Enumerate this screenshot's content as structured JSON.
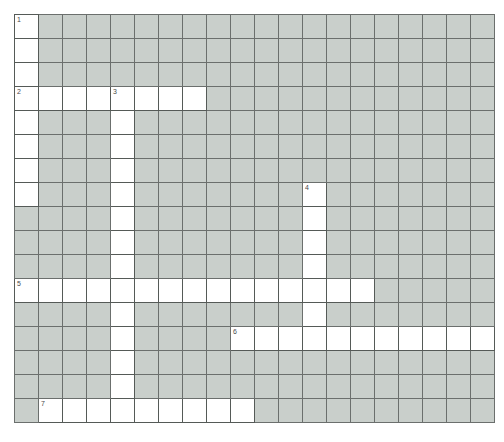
{
  "puzzle": {
    "type": "crossword-grid",
    "columns": 20,
    "rows": 17,
    "cell_size_px": 24,
    "origin_px": {
      "x": 14,
      "y": 14
    },
    "colors": {
      "background": "#ffffff",
      "open_cell": "#ffffff",
      "blocked_cell": "#c9cfcb",
      "grid_line": "#6e6e6e",
      "number_text": "#4a4a4a"
    },
    "clue_numbers": [
      {
        "label": "1",
        "row": 0,
        "col": 0
      },
      {
        "label": "2",
        "row": 3,
        "col": 0
      },
      {
        "label": "3",
        "row": 3,
        "col": 4
      },
      {
        "label": "4",
        "row": 7,
        "col": 12
      },
      {
        "label": "5",
        "row": 11,
        "col": 0
      },
      {
        "label": "6",
        "row": 13,
        "col": 9
      },
      {
        "label": "7",
        "row": 16,
        "col": 1
      }
    ],
    "open_cells": [
      [
        0,
        0
      ],
      [
        1,
        0
      ],
      [
        2,
        0
      ],
      [
        3,
        0
      ],
      [
        3,
        1
      ],
      [
        3,
        2
      ],
      [
        3,
        3
      ],
      [
        3,
        4
      ],
      [
        3,
        5
      ],
      [
        3,
        6
      ],
      [
        3,
        7
      ],
      [
        4,
        0
      ],
      [
        4,
        4
      ],
      [
        5,
        0
      ],
      [
        5,
        4
      ],
      [
        6,
        0
      ],
      [
        6,
        4
      ],
      [
        7,
        0
      ],
      [
        7,
        4
      ],
      [
        7,
        12
      ],
      [
        8,
        4
      ],
      [
        8,
        12
      ],
      [
        9,
        4
      ],
      [
        9,
        12
      ],
      [
        10,
        4
      ],
      [
        10,
        12
      ],
      [
        11,
        0
      ],
      [
        11,
        1
      ],
      [
        11,
        2
      ],
      [
        11,
        3
      ],
      [
        11,
        4
      ],
      [
        11,
        5
      ],
      [
        11,
        6
      ],
      [
        11,
        7
      ],
      [
        11,
        8
      ],
      [
        11,
        9
      ],
      [
        11,
        10
      ],
      [
        11,
        11
      ],
      [
        11,
        12
      ],
      [
        11,
        13
      ],
      [
        11,
        14
      ],
      [
        12,
        4
      ],
      [
        12,
        12
      ],
      [
        13,
        4
      ],
      [
        13,
        9
      ],
      [
        13,
        10
      ],
      [
        13,
        11
      ],
      [
        13,
        12
      ],
      [
        13,
        13
      ],
      [
        13,
        14
      ],
      [
        13,
        15
      ],
      [
        13,
        16
      ],
      [
        13,
        17
      ],
      [
        13,
        18
      ],
      [
        13,
        19
      ],
      [
        14,
        4
      ],
      [
        15,
        4
      ],
      [
        16,
        1
      ],
      [
        16,
        2
      ],
      [
        16,
        3
      ],
      [
        16,
        4
      ],
      [
        16,
        5
      ],
      [
        16,
        6
      ],
      [
        16,
        7
      ],
      [
        16,
        8
      ],
      [
        16,
        9
      ]
    ],
    "grid": [
      [
        "open",
        "blocked",
        "blocked",
        "blocked",
        "blocked",
        "blocked",
        "blocked",
        "blocked",
        "blocked",
        "blocked",
        "blocked",
        "blocked",
        "blocked",
        "blocked",
        "blocked",
        "blocked",
        "blocked",
        "blocked",
        "blocked",
        "blocked"
      ],
      [
        "open",
        "blocked",
        "blocked",
        "blocked",
        "blocked",
        "blocked",
        "blocked",
        "blocked",
        "blocked",
        "blocked",
        "blocked",
        "blocked",
        "blocked",
        "blocked",
        "blocked",
        "blocked",
        "blocked",
        "blocked",
        "blocked",
        "blocked"
      ],
      [
        "open",
        "blocked",
        "blocked",
        "blocked",
        "blocked",
        "blocked",
        "blocked",
        "blocked",
        "blocked",
        "blocked",
        "blocked",
        "blocked",
        "blocked",
        "blocked",
        "blocked",
        "blocked",
        "blocked",
        "blocked",
        "blocked",
        "blocked"
      ],
      [
        "open",
        "open",
        "open",
        "open",
        "open",
        "open",
        "open",
        "open",
        "blocked",
        "blocked",
        "blocked",
        "blocked",
        "blocked",
        "blocked",
        "blocked",
        "blocked",
        "blocked",
        "blocked",
        "blocked",
        "blocked"
      ],
      [
        "open",
        "blocked",
        "blocked",
        "blocked",
        "open",
        "blocked",
        "blocked",
        "blocked",
        "blocked",
        "blocked",
        "blocked",
        "blocked",
        "blocked",
        "blocked",
        "blocked",
        "blocked",
        "blocked",
        "blocked",
        "blocked",
        "blocked"
      ],
      [
        "open",
        "blocked",
        "blocked",
        "blocked",
        "open",
        "blocked",
        "blocked",
        "blocked",
        "blocked",
        "blocked",
        "blocked",
        "blocked",
        "blocked",
        "blocked",
        "blocked",
        "blocked",
        "blocked",
        "blocked",
        "blocked",
        "blocked"
      ],
      [
        "open",
        "blocked",
        "blocked",
        "blocked",
        "open",
        "blocked",
        "blocked",
        "blocked",
        "blocked",
        "blocked",
        "blocked",
        "blocked",
        "blocked",
        "blocked",
        "blocked",
        "blocked",
        "blocked",
        "blocked",
        "blocked",
        "blocked"
      ],
      [
        "open",
        "blocked",
        "blocked",
        "blocked",
        "open",
        "blocked",
        "blocked",
        "blocked",
        "blocked",
        "blocked",
        "blocked",
        "blocked",
        "open",
        "blocked",
        "blocked",
        "blocked",
        "blocked",
        "blocked",
        "blocked",
        "blocked"
      ],
      [
        "blocked",
        "blocked",
        "blocked",
        "blocked",
        "open",
        "blocked",
        "blocked",
        "blocked",
        "blocked",
        "blocked",
        "blocked",
        "blocked",
        "open",
        "blocked",
        "blocked",
        "blocked",
        "blocked",
        "blocked",
        "blocked",
        "blocked"
      ],
      [
        "blocked",
        "blocked",
        "blocked",
        "blocked",
        "open",
        "blocked",
        "blocked",
        "blocked",
        "blocked",
        "blocked",
        "blocked",
        "blocked",
        "open",
        "blocked",
        "blocked",
        "blocked",
        "blocked",
        "blocked",
        "blocked",
        "blocked"
      ],
      [
        "blocked",
        "blocked",
        "blocked",
        "blocked",
        "open",
        "blocked",
        "blocked",
        "blocked",
        "blocked",
        "blocked",
        "blocked",
        "blocked",
        "open",
        "blocked",
        "blocked",
        "blocked",
        "blocked",
        "blocked",
        "blocked",
        "blocked"
      ],
      [
        "open",
        "open",
        "open",
        "open",
        "open",
        "open",
        "open",
        "open",
        "open",
        "open",
        "open",
        "open",
        "open",
        "open",
        "open",
        "blocked",
        "blocked",
        "blocked",
        "blocked",
        "blocked"
      ],
      [
        "blocked",
        "blocked",
        "blocked",
        "blocked",
        "open",
        "blocked",
        "blocked",
        "blocked",
        "blocked",
        "blocked",
        "blocked",
        "blocked",
        "open",
        "blocked",
        "blocked",
        "blocked",
        "blocked",
        "blocked",
        "blocked",
        "blocked"
      ],
      [
        "blocked",
        "blocked",
        "blocked",
        "blocked",
        "open",
        "blocked",
        "blocked",
        "blocked",
        "blocked",
        "open",
        "open",
        "open",
        "open",
        "open",
        "open",
        "open",
        "open",
        "open",
        "open",
        "open"
      ],
      [
        "blocked",
        "blocked",
        "blocked",
        "blocked",
        "open",
        "blocked",
        "blocked",
        "blocked",
        "blocked",
        "blocked",
        "blocked",
        "blocked",
        "blocked",
        "blocked",
        "blocked",
        "blocked",
        "blocked",
        "blocked",
        "blocked",
        "blocked"
      ],
      [
        "blocked",
        "blocked",
        "blocked",
        "blocked",
        "open",
        "blocked",
        "blocked",
        "blocked",
        "blocked",
        "blocked",
        "blocked",
        "blocked",
        "blocked",
        "blocked",
        "blocked",
        "blocked",
        "blocked",
        "blocked",
        "blocked",
        "blocked"
      ],
      [
        "blocked",
        "open",
        "open",
        "open",
        "open",
        "open",
        "open",
        "open",
        "open",
        "open",
        "blocked",
        "blocked",
        "blocked",
        "blocked",
        "blocked",
        "blocked",
        "blocked",
        "blocked",
        "blocked",
        "blocked"
      ]
    ]
  }
}
